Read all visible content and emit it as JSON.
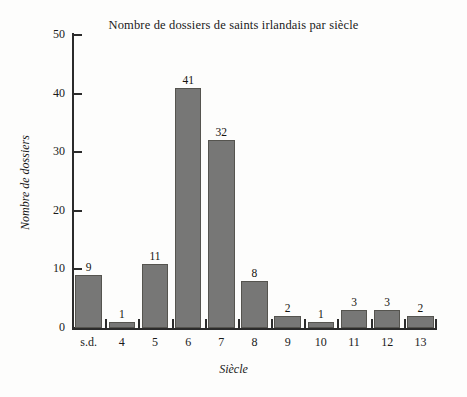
{
  "chart_data": {
    "type": "bar",
    "title": "Nombre de dossiers de saints irlandais par siècle",
    "xlabel": "Siècle",
    "ylabel": "Nombre de dossiers",
    "categories": [
      "s.d.",
      "4",
      "5",
      "6",
      "7",
      "8",
      "9",
      "10",
      "11",
      "12",
      "13"
    ],
    "values": [
      9,
      1,
      11,
      41,
      32,
      8,
      2,
      1,
      3,
      3,
      2
    ],
    "value_labels": [
      "9",
      "1",
      "11",
      "41",
      "32",
      "8",
      "2",
      "1",
      "3",
      "3",
      "2"
    ],
    "ylim": [
      0,
      50
    ],
    "yticks": [
      0,
      10,
      20,
      30,
      40,
      50
    ],
    "ytick_labels": [
      "0",
      "10",
      "20",
      "30",
      "40",
      "50"
    ],
    "grid": false,
    "legend": null,
    "bar_color": "#777776",
    "bar_edge_color": "#55544f",
    "axis_color": "#2b2b2b",
    "background_color": "#fdfdfc",
    "text_color": "#1a1a1a"
  }
}
